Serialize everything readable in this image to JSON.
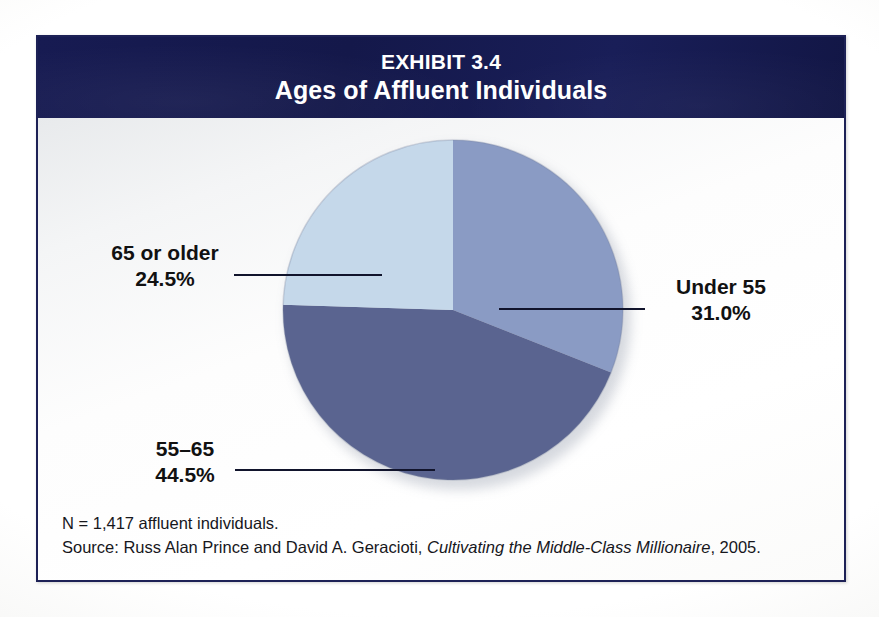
{
  "header": {
    "exhibit_number": "EXHIBIT 3.4",
    "title": "Ages of Affluent Individuals"
  },
  "footnotes": {
    "sample_size": "N = 1,417 affluent individuals.",
    "source_prefix": "Source: Russ Alan Prince and David A. Geracioti, ",
    "source_book": "Cultivating the Middle-Class Millionaire",
    "source_suffix": ", 2005."
  },
  "colors": {
    "header_navy": "#161a4e",
    "frame_border": "#1d2156",
    "slice_under55": "#8a9bc4",
    "slice_55_65": "#5a6490",
    "slice_65_older": "#c5d8ea",
    "leader_line": "#11142c",
    "label_text": "#111111"
  },
  "chart_data": {
    "type": "pie",
    "title": "Ages of Affluent Individuals",
    "subtitle": "EXHIBIT 3.4",
    "categories": [
      "Under 55",
      "55–65",
      "65 or older"
    ],
    "values": [
      31.0,
      44.5,
      24.5
    ],
    "value_labels": [
      "31.0%",
      "44.5%",
      "24.5%"
    ],
    "unit": "percent",
    "total": 100.0,
    "sample_size": 1417,
    "legend": "none",
    "labels_position": "outside-with-leader-lines",
    "start_angle_deg": 0,
    "direction": "clockwise",
    "slices": [
      {
        "name": "Under 55",
        "value": 31.0,
        "label": "Under 55",
        "value_label": "31.0%",
        "color": "#8a9bc4",
        "start_angle_deg": 0,
        "end_angle_deg": 111.6
      },
      {
        "name": "55–65",
        "value": 44.5,
        "label": "55–65",
        "value_label": "44.5%",
        "color": "#5a6490",
        "start_angle_deg": 111.6,
        "end_angle_deg": 271.8
      },
      {
        "name": "65 or older",
        "value": 24.5,
        "label": "65 or older",
        "value_label": "24.5%",
        "color": "#c5d8ea",
        "start_angle_deg": 271.8,
        "end_angle_deg": 360
      }
    ]
  }
}
